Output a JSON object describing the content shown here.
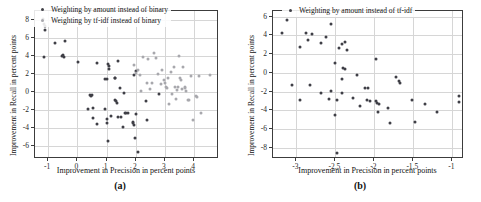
{
  "figure": {
    "panels": [
      {
        "caption": "(a)",
        "legend_position": "top-left-inside",
        "chart": {
          "type": "scatter",
          "title": "",
          "xlabel": "Improvement in Precision in percent points",
          "ylabel": "Improvement in Recall in percent points",
          "xlim": [
            -1.45,
            4.85
          ],
          "ylim": [
            -7.4,
            9.0
          ],
          "xticks": [
            -1,
            0,
            1,
            2,
            3,
            4
          ],
          "yticks": [
            -6,
            -4,
            -2,
            0,
            2,
            4,
            6,
            8
          ],
          "grid": true,
          "series": [
            {
              "name": "Weighting by amount instead of binary",
              "color": "#3f3f46",
              "points": [
                [
                  -1.18,
                  8.1
                ],
                [
                  -1.15,
                  7.6
                ],
                [
                  -1.12,
                  7.3
                ],
                [
                  -1.1,
                  6.9
                ],
                [
                  -1.13,
                  3.95
                ],
                [
                  -0.78,
                  5.5
                ],
                [
                  -0.42,
                  5.65
                ],
                [
                  -0.52,
                  4.05
                ],
                [
                  -0.48,
                  4.1
                ],
                [
                  -0.45,
                  3.95
                ],
                [
                  0.02,
                  3.35
                ],
                [
                  0.66,
                  3.25
                ],
                [
                  0.95,
                  1.45
                ],
                [
                  1.02,
                  1.5
                ],
                [
                  1.05,
                  3.1
                ],
                [
                  1.08,
                  2.9
                ],
                [
                  1.1,
                  2.55
                ],
                [
                  1.28,
                  1.6
                ],
                [
                  1.3,
                  1.55
                ],
                [
                  1.45,
                  0.5
                ],
                [
                  1.6,
                  -0.1
                ],
                [
                  1.38,
                  3.45
                ],
                [
                  0.38,
                  -1.85
                ],
                [
                  0.55,
                  -1.8
                ],
                [
                  0.52,
                  -2.85
                ],
                [
                  0.42,
                  -0.3
                ],
                [
                  0.48,
                  -0.45
                ],
                [
                  0.5,
                  -0.35
                ],
                [
                  0.66,
                  -3.55
                ],
                [
                  0.95,
                  -1.9
                ],
                [
                  1.0,
                  -2.95
                ],
                [
                  1.02,
                  -3.45
                ],
                [
                  1.05,
                  -5.35
                ],
                [
                  1.15,
                  -2.65
                ],
                [
                  1.3,
                  -0.85
                ],
                [
                  1.32,
                  -0.95
                ],
                [
                  1.35,
                  -1.15
                ],
                [
                  1.4,
                  -2.8
                ],
                [
                  1.5,
                  -2.75
                ],
                [
                  1.58,
                  -3.85
                ],
                [
                  1.62,
                  -2.25
                ],
                [
                  1.65,
                  -2.3
                ],
                [
                  1.72,
                  -2.3
                ],
                [
                  1.9,
                  -3.3
                ],
                [
                  1.92,
                  -3.45
                ],
                [
                  1.95,
                  -3.6
                ],
                [
                  1.98,
                  -5.05
                ],
                [
                  2.02,
                  -2.45
                ],
                [
                  2.08,
                  -6.65
                ],
                [
                  1.95,
                  1.95
                ],
                [
                  2.02,
                  2.4
                ],
                [
                  2.38,
                  -3.1
                ],
                [
                  2.35,
                  -1.0
                ],
                [
                  2.78,
                  -0.15
                ]
              ]
            },
            {
              "name": "Weighting by tf-idf instead of binary",
              "color": "#a8a8ad",
              "points": [
                [
                  2.02,
                  2.15
                ],
                [
                  2.08,
                  2.5
                ],
                [
                  2.15,
                  1.9
                ],
                [
                  2.25,
                  3.85
                ],
                [
                  2.38,
                  1.0
                ],
                [
                  2.42,
                  3.65
                ],
                [
                  2.62,
                  4.3
                ],
                [
                  2.68,
                  3.75
                ],
                [
                  2.75,
                  2.0
                ],
                [
                  2.9,
                  2.45
                ],
                [
                  2.95,
                  1.35
                ],
                [
                  3.0,
                  1.0
                ],
                [
                  3.05,
                  0.55
                ],
                [
                  3.08,
                  0.45
                ],
                [
                  3.12,
                  1.6
                ],
                [
                  3.2,
                  2.2
                ],
                [
                  3.3,
                  2.75
                ],
                [
                  3.35,
                  0.6
                ],
                [
                  3.4,
                  0.3
                ],
                [
                  3.45,
                  0.55
                ],
                [
                  3.48,
                  4.05
                ],
                [
                  3.5,
                  1.55
                ],
                [
                  3.55,
                  1.35
                ],
                [
                  3.6,
                  0.35
                ],
                [
                  3.62,
                  2.75
                ],
                [
                  3.68,
                  0.6
                ],
                [
                  3.7,
                  0.45
                ],
                [
                  3.72,
                  0.1
                ],
                [
                  3.78,
                  -0.9
                ],
                [
                  3.82,
                  -0.85
                ],
                [
                  3.9,
                  1.75
                ],
                [
                  3.95,
                  -3.1
                ],
                [
                  4.05,
                  -0.45
                ],
                [
                  4.1,
                  -0.5
                ],
                [
                  4.15,
                  1.8
                ],
                [
                  4.25,
                  -2.3
                ],
                [
                  4.55,
                  1.9
                ],
                [
                  2.85,
                  0.9
                ],
                [
                  3.25,
                  -0.15
                ],
                [
                  3.38,
                  -0.75
                ],
                [
                  2.55,
                  1.05
                ],
                [
                  2.48,
                  0.35
                ],
                [
                  1.95,
                  3.05
                ],
                [
                  2.18,
                  0.15
                ],
                [
                  3.15,
                  -1.35
                ]
              ]
            }
          ]
        }
      },
      {
        "caption": "(b)",
        "legend_position": "top-right-inside",
        "chart": {
          "type": "scatter",
          "title": "",
          "xlabel": "Improvement in Precision in percent points",
          "ylabel": "Improvement in Recall in percent points",
          "xlim": [
            -3.3,
            -0.85
          ],
          "ylim": [
            -9.2,
            6.6
          ],
          "xticks": [
            -3,
            -2.5,
            -2,
            -1.5,
            -1
          ],
          "yticks": [
            -8,
            -6,
            -4,
            -2,
            0,
            2,
            4,
            6
          ],
          "grid": true,
          "series": [
            {
              "name": "Weighting by amount instead of tf-idf",
              "color": "#3f3f46",
              "points": [
                [
                  -3.18,
                  4.2
                ],
                [
                  -3.12,
                  5.6
                ],
                [
                  -2.95,
                  2.8
                ],
                [
                  -2.88,
                  4.3
                ],
                [
                  -2.85,
                  3.5
                ],
                [
                  -2.8,
                  4.15
                ],
                [
                  -2.68,
                  3.15
                ],
                [
                  -2.62,
                  3.8
                ],
                [
                  -2.55,
                  5.25
                ],
                [
                  -2.45,
                  2.65
                ],
                [
                  -2.42,
                  3.1
                ],
                [
                  -2.38,
                  3.3
                ],
                [
                  -2.35,
                  2.4
                ],
                [
                  -2.5,
                  1.05
                ],
                [
                  -2.4,
                  0.55
                ],
                [
                  -2.38,
                  0.4
                ],
                [
                  -2.42,
                  -0.7
                ],
                [
                  -2.22,
                  -0.2
                ],
                [
                  -1.98,
                  1.45
                ],
                [
                  -1.72,
                  -0.4
                ],
                [
                  -1.68,
                  -0.9
                ],
                [
                  -1.67,
                  -1.1
                ],
                [
                  -3.05,
                  -1.25
                ],
                [
                  -2.82,
                  -1.25
                ],
                [
                  -2.95,
                  -2.9
                ],
                [
                  -2.68,
                  -2.2
                ],
                [
                  -2.58,
                  -2.8
                ],
                [
                  -2.55,
                  -1.95
                ],
                [
                  -2.48,
                  -2.95
                ],
                [
                  -2.42,
                  -2.2
                ],
                [
                  -2.5,
                  -4.5
                ],
                [
                  -2.28,
                  -2.65
                ],
                [
                  -2.18,
                  -3.5
                ],
                [
                  -2.12,
                  -1.6
                ],
                [
                  -2.08,
                  -1.65
                ],
                [
                  -2.1,
                  -2.95
                ],
                [
                  -2.05,
                  -3.0
                ],
                [
                  -1.98,
                  -3.05
                ],
                [
                  -1.96,
                  -3.2
                ],
                [
                  -1.94,
                  -3.3
                ],
                [
                  -1.95,
                  -4.2
                ],
                [
                  -1.82,
                  -3.8
                ],
                [
                  -1.8,
                  -5.35
                ],
                [
                  -1.52,
                  -2.95
                ],
                [
                  -1.48,
                  -5.3
                ],
                [
                  -1.35,
                  -3.3
                ],
                [
                  -1.2,
                  -4.2
                ],
                [
                  -0.92,
                  -2.5
                ],
                [
                  -0.92,
                  -3.15
                ],
                [
                  -2.48,
                  -8.55
                ]
              ]
            }
          ]
        }
      }
    ]
  }
}
